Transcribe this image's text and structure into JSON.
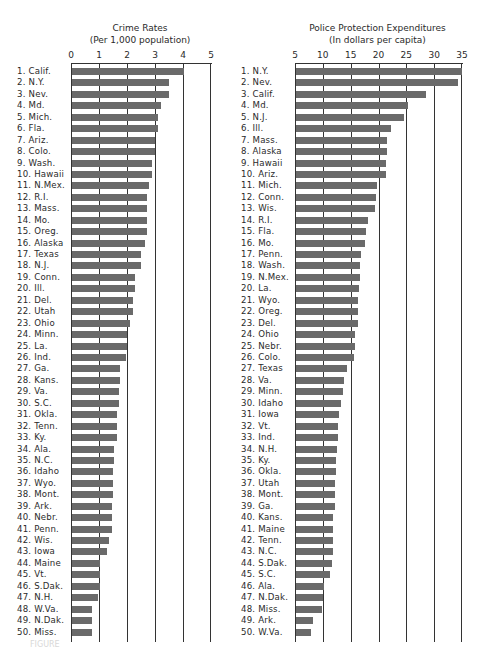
{
  "chart_data": [
    {
      "type": "bar",
      "orientation": "horizontal",
      "title": "Crime Rates",
      "subtitle": "(Per 1,000 population)",
      "xlabel": "",
      "ylabel": "",
      "xlim": [
        0,
        5
      ],
      "ticks": [
        "0",
        "1",
        "2",
        "3",
        "4",
        "5"
      ],
      "grid": true,
      "categories": [
        "1. Calif.",
        "2. N.Y.",
        "3. Nev.",
        "4. Md.",
        "5. Mich.",
        "6. Fla.",
        "7. Ariz.",
        "8. Colo.",
        "9. Wash.",
        "10. Hawaii",
        "11. N.Mex.",
        "12. R.I.",
        "13. Mass.",
        "14. Mo.",
        "15. Oreg.",
        "16. Alaska",
        "17. Texas",
        "18. N.J.",
        "19. Conn.",
        "20. Ill.",
        "21. Del.",
        "22. Utah",
        "23. Ohio",
        "24. Minn.",
        "25. La.",
        "26. Ind.",
        "27. Ga.",
        "28. Kans.",
        "29. Va.",
        "30. S.C.",
        "31. Okla.",
        "32. Tenn.",
        "33. Ky.",
        "34. Ala.",
        "35. N.C.",
        "36. Idaho",
        "37. Wyo.",
        "38. Mont.",
        "39. Ark.",
        "40. Nebr.",
        "41. Penn.",
        "42. Wis.",
        "43. Iowa",
        "44. Maine",
        "45. Vt.",
        "46. S.Dak.",
        "47. N.H.",
        "48. W.Va.",
        "49. N.Dak.",
        "50. Miss."
      ],
      "values": [
        4.05,
        3.5,
        3.5,
        3.2,
        3.1,
        3.1,
        3.0,
        3.0,
        2.9,
        2.9,
        2.8,
        2.7,
        2.7,
        2.7,
        2.7,
        2.65,
        2.5,
        2.5,
        2.3,
        2.3,
        2.2,
        2.2,
        2.1,
        2.0,
        2.0,
        1.95,
        1.75,
        1.75,
        1.7,
        1.7,
        1.65,
        1.65,
        1.65,
        1.55,
        1.55,
        1.5,
        1.5,
        1.5,
        1.45,
        1.45,
        1.45,
        1.35,
        1.3,
        1.05,
        1.05,
        1.05,
        0.95,
        0.75,
        0.75,
        0.75
      ]
    },
    {
      "type": "bar",
      "orientation": "horizontal",
      "title": "Police Protection Expenditures",
      "subtitle": "(In dollars per capita)",
      "xlabel": "",
      "ylabel": "",
      "xlim": [
        5,
        35
      ],
      "ticks": [
        "5",
        "10",
        "15",
        "20",
        "25",
        "30",
        "35"
      ],
      "grid": true,
      "categories": [
        "1. N.Y.",
        "2. Nev.",
        "3. Calif.",
        "4. Md.",
        "5. N.J.",
        "6. Ill.",
        "7. Mass.",
        "8. Alaska",
        "9. Hawaii",
        "10. Ariz.",
        "11. Mich.",
        "12. Conn.",
        "13. Wis.",
        "14. R.I.",
        "15. Fla.",
        "16. Mo.",
        "17. Penn.",
        "18. Wash.",
        "19. N.Mex.",
        "20. La.",
        "21. Wyo.",
        "22. Oreg.",
        "23. Del.",
        "24. Ohio",
        "25. Nebr.",
        "26. Colo.",
        "27. Texas",
        "28. Va.",
        "29. Minn.",
        "30. Idaho",
        "31. Iowa",
        "32. Vt.",
        "33. Ind.",
        "34. N.H.",
        "35. Ky.",
        "36. Okla.",
        "37. Utah",
        "38. Mont.",
        "39. Ga.",
        "40. Kans.",
        "41. Maine",
        "42. Tenn.",
        "43. N.C.",
        "44. S.Dak.",
        "45. S.C.",
        "46. Ala.",
        "47. N.Dak.",
        "48. Miss.",
        "49. Ark.",
        "50. W.Va."
      ],
      "values": [
        35.0,
        34.3,
        28.5,
        25.3,
        24.5,
        22.3,
        21.6,
        21.5,
        21.4,
        21.4,
        19.7,
        19.5,
        19.3,
        18.2,
        17.7,
        17.6,
        16.8,
        16.7,
        16.6,
        16.5,
        16.4,
        16.4,
        16.4,
        15.8,
        15.7,
        15.6,
        14.4,
        13.8,
        13.6,
        13.2,
        12.9,
        12.8,
        12.7,
        12.6,
        12.3,
        12.3,
        12.2,
        12.2,
        12.1,
        11.9,
        11.8,
        11.8,
        11.8,
        11.6,
        11.2,
        10.2,
        10.0,
        9.8,
        8.2,
        7.8
      ]
    }
  ],
  "caption": "FIGURE"
}
